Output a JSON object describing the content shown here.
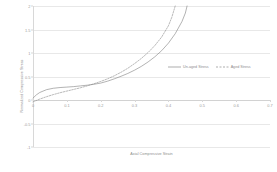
{
  "chart_data": {
    "type": "line",
    "title": "",
    "subtitle": "",
    "xlabel": "Axial Compressive Strain",
    "ylabel": "Normalized Compressive Stress",
    "xlim": [
      0,
      0.7
    ],
    "ylim": [
      -1,
      2
    ],
    "x_ticks": [
      "0",
      "0.1",
      "0.2",
      "0.3",
      "0.4",
      "0.5",
      "0.6",
      "0.7"
    ],
    "x_tick_values": [
      0,
      0.1,
      0.2,
      0.3,
      0.4,
      0.5,
      0.6,
      0.7
    ],
    "y_ticks": [
      "2",
      "1.5",
      "1",
      "0.5",
      "0",
      "-0.5",
      "-1"
    ],
    "y_tick_values": [
      2,
      1.5,
      1,
      0.5,
      0,
      -0.5,
      -1
    ],
    "grid": "horizontal",
    "legend_position": "inside-right-center",
    "zero_axis_line": true,
    "series": [
      {
        "name": "Un-aged Stress",
        "style": "solid",
        "color": "#7f7f7f",
        "x": [
          0,
          0.01,
          0.02,
          0.04,
          0.06,
          0.08,
          0.1,
          0.12,
          0.14,
          0.16,
          0.18,
          0.2,
          0.22,
          0.24,
          0.26,
          0.28,
          0.3,
          0.32,
          0.34,
          0.36,
          0.38,
          0.4,
          0.42,
          0.44,
          0.45,
          0.455
        ],
        "y": [
          0.04,
          0.11,
          0.16,
          0.22,
          0.25,
          0.265,
          0.275,
          0.285,
          0.3,
          0.315,
          0.335,
          0.36,
          0.4,
          0.45,
          0.505,
          0.565,
          0.635,
          0.715,
          0.81,
          0.92,
          1.05,
          1.21,
          1.41,
          1.67,
          1.85,
          2.0
        ]
      },
      {
        "name": "Aged Stress",
        "style": "dashed",
        "color": "#8a8a8a",
        "x": [
          0,
          0.02,
          0.04,
          0.06,
          0.08,
          0.1,
          0.12,
          0.14,
          0.16,
          0.18,
          0.2,
          0.22,
          0.24,
          0.26,
          0.28,
          0.3,
          0.32,
          0.34,
          0.36,
          0.38,
          0.4,
          0.41,
          0.42
        ],
        "y": [
          -0.04,
          0.02,
          0.07,
          0.115,
          0.155,
          0.19,
          0.225,
          0.26,
          0.3,
          0.345,
          0.395,
          0.45,
          0.515,
          0.59,
          0.675,
          0.775,
          0.885,
          1.01,
          1.16,
          1.34,
          1.58,
          1.76,
          2.0
        ]
      }
    ]
  },
  "legend": {
    "entries": [
      {
        "label": "Un-aged Stress"
      },
      {
        "label": "Aged Stress"
      }
    ]
  }
}
